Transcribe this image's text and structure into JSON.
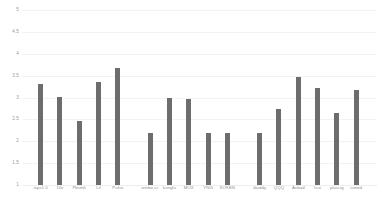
{
  "chart_data": {
    "type": "bar",
    "title": "",
    "subtitle": "",
    "xlabel": "",
    "ylabel": "",
    "ylim": [
      1,
      5
    ],
    "grid": true,
    "legend": "none",
    "orientation": "vertical",
    "bar_color": "#6d6d6d",
    "background_color": "#ffffff",
    "gridline_color": "#f3f3f3",
    "axis_label_color": "#9a9a9a",
    "yticks": [
      5,
      4.5,
      4,
      3.5,
      3,
      2.5,
      2,
      1.5,
      1
    ],
    "ytick_labels": [
      "5",
      "4.5",
      "4",
      "3.5",
      "3",
      "2.5",
      "2",
      "1.5",
      "1"
    ],
    "categories": [
      "iops1.0",
      "Dlo",
      "Pbsmh",
      "Lil",
      "Pulse",
      "weibo.cc",
      "kungfu",
      "MOX",
      "YNG",
      "KOKEN",
      "ibuddy",
      "QQQ",
      "Anbad",
      "Isui",
      "pluscig",
      "ismod"
    ],
    "values": [
      3.3,
      3.02,
      2.47,
      3.36,
      3.68,
      2.2,
      3.0,
      2.96,
      2.2,
      2.2,
      2.2,
      2.73,
      3.46,
      3.22,
      2.64,
      3.17
    ],
    "groups": [
      {
        "name": "group-1",
        "start_index": 0,
        "count": 5
      },
      {
        "name": "group-2",
        "start_index": 5,
        "count": 5
      },
      {
        "name": "group-3",
        "start_index": 10,
        "count": 6
      }
    ]
  }
}
